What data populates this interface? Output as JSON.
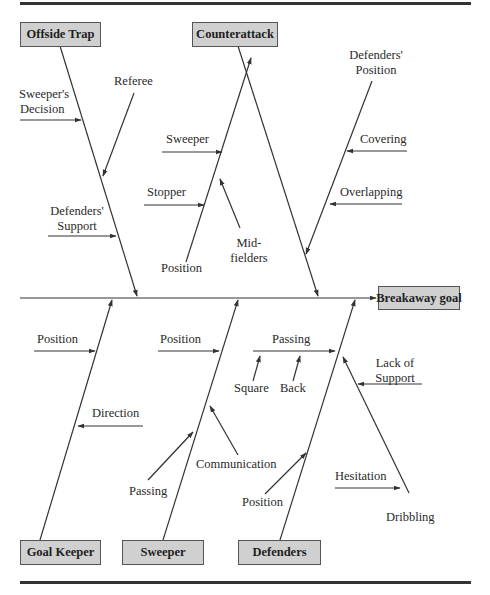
{
  "diagram": {
    "type": "fishbone",
    "effect": "Breakaway goal",
    "categories": [
      {
        "name": "Offside Trap",
        "position": "top",
        "causes": [
          "Sweeper's Decision",
          "Referee",
          "Defenders' Support"
        ]
      },
      {
        "name": "Counterattack",
        "position": "top",
        "causes": [
          {
            "name": "Position",
            "sub_causes": [
              "Sweeper",
              "Stopper",
              "Mid-fielders"
            ]
          },
          {
            "name": "Defenders' Position",
            "sub_causes": [
              "Covering",
              "Overlapping"
            ]
          }
        ]
      },
      {
        "name": "Goal Keeper",
        "position": "bottom",
        "causes": [
          "Position",
          "Direction"
        ]
      },
      {
        "name": "Sweeper",
        "position": "bottom",
        "causes": [
          "Position",
          "Passing",
          "Communication"
        ]
      },
      {
        "name": "Defenders",
        "position": "bottom",
        "causes": [
          {
            "name": "Passing",
            "sub_causes": [
              "Square",
              "Back"
            ]
          },
          "Position",
          {
            "name": "Dribbling",
            "sub_causes": [
              "Lack of Support",
              "Hesitation"
            ]
          }
        ]
      }
    ]
  },
  "boxes": {
    "offside_trap": "Offside Trap",
    "counterattack": "Counterattack",
    "breakaway_goal": "Breakaway goal",
    "goal_keeper": "Goal Keeper",
    "sweeper": "Sweeper",
    "defenders": "Defenders"
  },
  "labels": {
    "sweepers_decision_1": "Sweeper's",
    "sweepers_decision_2": "Decision",
    "referee": "Referee",
    "defenders_support_1": "Defenders'",
    "defenders_support_2": "Support",
    "ca_sweeper": "Sweeper",
    "ca_stopper": "Stopper",
    "ca_position": "Position",
    "ca_midfielders_1": "Mid-",
    "ca_midfielders_2": "fielders",
    "defenders_position_1": "Defenders'",
    "defenders_position_2": "Position",
    "covering": "Covering",
    "overlapping": "Overlapping",
    "gk_position": "Position",
    "gk_direction": "Direction",
    "sw_position": "Position",
    "sw_passing": "Passing",
    "sw_communication": "Communication",
    "df_passing": "Passing",
    "df_square": "Square",
    "df_back": "Back",
    "df_position": "Position",
    "lack_of_support_1": "Lack of",
    "lack_of_support_2": "Support",
    "hesitation": "Hesitation",
    "dribbling": "Dribbling"
  },
  "colors": {
    "box_fill": "#d0d0d0",
    "box_border": "#555555",
    "line": "#333333",
    "text": "#2a2a2a"
  }
}
